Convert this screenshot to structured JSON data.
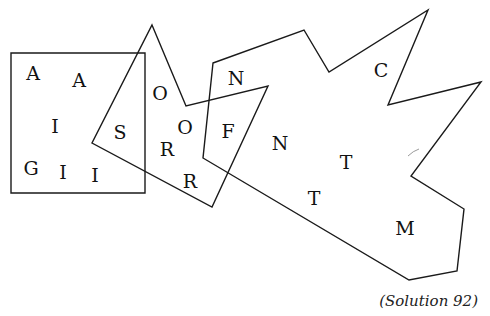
{
  "puzzle": {
    "caption": "(Solution 92)",
    "shapes": {
      "square": {
        "points": "11,53 145,53 145,193 11,193"
      },
      "kite": {
        "points": "152,25 186,106 268,86 212,207 92,143"
      },
      "star": {
        "points": "213,63 304,30 329,72 428,10 388,105 481,82 411,176 464,209 457,271 409,280 203,158"
      }
    },
    "letters": [
      {
        "char": "A",
        "x": 33,
        "y": 73
      },
      {
        "char": "A",
        "x": 79,
        "y": 80
      },
      {
        "char": "I",
        "x": 55,
        "y": 126
      },
      {
        "char": "G",
        "x": 31,
        "y": 168
      },
      {
        "char": "I",
        "x": 63,
        "y": 172
      },
      {
        "char": "I",
        "x": 95,
        "y": 175
      },
      {
        "char": "S",
        "x": 120,
        "y": 132
      },
      {
        "char": "O",
        "x": 160,
        "y": 93
      },
      {
        "char": "O",
        "x": 185,
        "y": 127
      },
      {
        "char": "R",
        "x": 167,
        "y": 149
      },
      {
        "char": "R",
        "x": 190,
        "y": 181
      },
      {
        "char": "N",
        "x": 236,
        "y": 78
      },
      {
        "char": "F",
        "x": 228,
        "y": 131
      },
      {
        "char": "N",
        "x": 280,
        "y": 143
      },
      {
        "char": "C",
        "x": 381,
        "y": 70
      },
      {
        "char": "T",
        "x": 346,
        "y": 162
      },
      {
        "char": "T",
        "x": 314,
        "y": 198
      },
      {
        "char": "M",
        "x": 405,
        "y": 228
      }
    ]
  }
}
